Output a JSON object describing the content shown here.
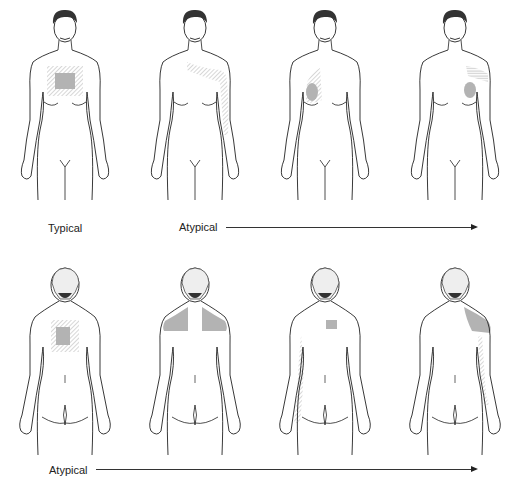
{
  "rows": [
    {
      "view": "front",
      "figures": [
        {
          "id": "front-1",
          "category": "Typical",
          "region": "central chest (retrosternal)",
          "shade": "#b3b3b3"
        },
        {
          "id": "front-2",
          "category": "Atypical",
          "region": "neck, jaw, left shoulder and inner left arm",
          "shade": "#b3b3b3"
        },
        {
          "id": "front-3",
          "category": "Atypical",
          "region": "right chest",
          "shade": "#b3b3b3"
        },
        {
          "id": "front-4",
          "category": "Atypical",
          "region": "left chest and left shoulder",
          "shade": "#b3b3b3"
        }
      ],
      "labels": {
        "typical": "Typical",
        "atypical": "Atypical"
      }
    },
    {
      "view": "back",
      "figures": [
        {
          "id": "back-1",
          "category": "Atypical",
          "region": "upper back between shoulder blades",
          "shade": "#b3b3b3"
        },
        {
          "id": "back-2",
          "category": "Atypical",
          "region": "both shoulders / trapezius",
          "shade": "#b3b3b3"
        },
        {
          "id": "back-3",
          "category": "Atypical",
          "region": "small interscapular area and right arm",
          "shade": "#b3b3b3"
        },
        {
          "id": "back-4",
          "category": "Atypical",
          "region": "left shoulder and left arm",
          "shade": "#b3b3b3"
        }
      ],
      "labels": {
        "atypical": "Atypical"
      }
    }
  ],
  "colors": {
    "line": "#222222",
    "shade": "#b3b3b3",
    "hatch": "#9a9a9a"
  }
}
